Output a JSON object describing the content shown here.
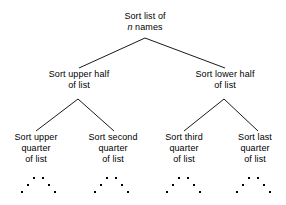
{
  "diagram": {
    "type": "tree",
    "background_color": "#ffffff",
    "text_color": "#000000",
    "edge_color": "#1a1a1a",
    "levels": 3,
    "root": {
      "id": "root",
      "lines": [
        "Sort list of",
        "n names"
      ],
      "line1": "Sort list of",
      "line2_var": "n",
      "line2_rest": " names"
    },
    "level2": [
      {
        "id": "upper-half",
        "line1": "Sort upper half",
        "line2": "of list"
      },
      {
        "id": "lower-half",
        "line1": "Sort lower half",
        "line2": "of list"
      }
    ],
    "leaves": [
      {
        "id": "upper-quarter",
        "line1": "Sort upper",
        "line2": "quarter",
        "line3": "of list"
      },
      {
        "id": "second-quarter",
        "line1": "Sort second",
        "line2": "quarter",
        "line3": "of list"
      },
      {
        "id": "third-quarter",
        "line1": "Sort third",
        "line2": "quarter",
        "line3": "of list"
      },
      {
        "id": "last-quarter",
        "line1": "Sort last",
        "line2": "quarter",
        "line3": "of list"
      }
    ],
    "ellipses": [
      {
        "id": "ellipsis-1",
        "under": "upper-quarter"
      },
      {
        "id": "ellipsis-2",
        "under": "second-quarter"
      },
      {
        "id": "ellipsis-3",
        "under": "third-quarter"
      },
      {
        "id": "ellipsis-4",
        "under": "last-quarter"
      }
    ],
    "edges": [
      {
        "from": "root",
        "to": "upper-half",
        "x1": 145,
        "y1": 38,
        "x2": 79,
        "y2": 68
      },
      {
        "from": "root",
        "to": "lower-half",
        "x1": 145,
        "y1": 38,
        "x2": 225,
        "y2": 68
      },
      {
        "from": "upper-half",
        "to": "upper-quarter",
        "x1": 78,
        "y1": 99,
        "x2": 36,
        "y2": 131
      },
      {
        "from": "upper-half",
        "to": "second-quarter",
        "x1": 78,
        "y1": 99,
        "x2": 114,
        "y2": 131
      },
      {
        "from": "lower-half",
        "to": "third-quarter",
        "x1": 224,
        "y1": 99,
        "x2": 184,
        "y2": 131
      },
      {
        "from": "lower-half",
        "to": "last-quarter",
        "x1": 224,
        "y1": 99,
        "x2": 258,
        "y2": 131
      }
    ]
  }
}
